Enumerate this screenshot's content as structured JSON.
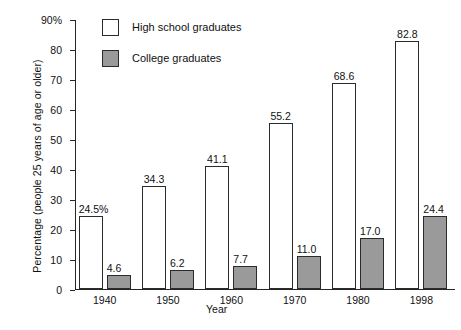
{
  "chart_data": {
    "type": "bar",
    "title": "",
    "xlabel": "Year",
    "ylabel": "Percentage (people 25 years of age or older)",
    "categories": [
      "1940",
      "1950",
      "1960",
      "1970",
      "1980",
      "1998"
    ],
    "series": [
      {
        "name": "High school graduates",
        "color": "#ffffff",
        "values": [
          24.5,
          34.3,
          41.1,
          55.2,
          68.6,
          82.8
        ],
        "labels": [
          "24.5%",
          "34.3",
          "41.1",
          "55.2",
          "68.6",
          "82.8"
        ]
      },
      {
        "name": "College graduates",
        "color": "#9a9a9a",
        "values": [
          4.6,
          6.2,
          7.7,
          11.0,
          17.0,
          24.4
        ],
        "labels": [
          "4.6",
          "6.2",
          "7.7",
          "11.0",
          "17.0",
          "24.4"
        ]
      }
    ],
    "ylim": [
      0,
      90
    ],
    "yticks": [
      0,
      10,
      20,
      30,
      40,
      50,
      60,
      70,
      80,
      90
    ],
    "ytick_labels": [
      "0",
      "10",
      "20",
      "30",
      "40",
      "50",
      "60",
      "70",
      "80",
      "90%"
    ],
    "grid": false,
    "legend_position": "top-left-inside"
  },
  "legend": {
    "items": [
      {
        "label": "High school graduates",
        "swatch": "white-square-icon"
      },
      {
        "label": "College graduates",
        "swatch": "grey-square-icon"
      }
    ]
  }
}
